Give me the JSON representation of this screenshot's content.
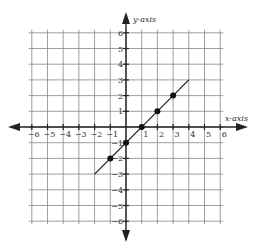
{
  "chart_data": {
    "type": "line",
    "title": "",
    "xlabel": "x-axis",
    "ylabel": "y-axis",
    "xlim": [
      -6,
      6
    ],
    "ylim": [
      -6,
      6
    ],
    "grid": true,
    "x_ticks": [
      -6,
      -5,
      -4,
      -3,
      -2,
      -1,
      1,
      2,
      3,
      4,
      5,
      6
    ],
    "y_ticks": [
      6,
      5,
      4,
      3,
      2,
      1,
      -1,
      -2,
      -3,
      -4,
      -5,
      -6
    ],
    "x_tick_labels": [
      "−6",
      "−5",
      "−4",
      "−3",
      "−2",
      "−1",
      "1",
      "2",
      "3",
      "4",
      "5",
      "6"
    ],
    "y_tick_labels": [
      "6",
      "5",
      "4",
      "3",
      "2",
      "1",
      "−1",
      "−2",
      "−3",
      "−4",
      "−5",
      "−6"
    ],
    "series": [
      {
        "name": "line",
        "equation": "y = x - 1",
        "segment": [
          [
            -2,
            -3
          ],
          [
            4,
            3
          ]
        ],
        "points": [
          [
            -1,
            -2
          ],
          [
            0,
            -1
          ],
          [
            1,
            0
          ],
          [
            2,
            1
          ],
          [
            3,
            2
          ]
        ]
      }
    ],
    "colors": {
      "grid": "#888888",
      "axis": "#222222",
      "line": "#222222",
      "point": "#111111"
    }
  }
}
